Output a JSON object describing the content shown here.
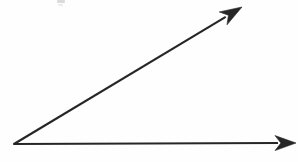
{
  "figure": {
    "background_color": "#fefefe",
    "stroke_color": "#262626",
    "width": 298,
    "height": 162,
    "vertex_label": "",
    "caption": ""
  },
  "chart_data": {
    "type": "diagram",
    "subtitle": "",
    "xlabel": "",
    "ylabel": "",
    "grid": false,
    "legend": "none",
    "axis_ranges": {
      "x": [
        0,
        298
      ],
      "y": [
        0,
        162
      ]
    },
    "coordinate_note": "Pixel coordinates, origin at top-left of the 298x162 image.",
    "vertex": {
      "x": 14,
      "y": 144
    },
    "rays": [
      {
        "name": "horizontal-ray",
        "label": "",
        "from": {
          "x": 14,
          "y": 144
        },
        "to": {
          "x": 296,
          "y": 143
        },
        "length_px": 282,
        "angle_deg": 0,
        "arrowhead": "filled-triangle",
        "arrowhead_length_px": 21,
        "arrowhead_width_px": 15,
        "stroke_width_px": 2.1,
        "color": "#262626"
      },
      {
        "name": "diagonal-ray",
        "label": "",
        "from": {
          "x": 14,
          "y": 144
        },
        "to": {
          "x": 242,
          "y": 7
        },
        "length_px": 266,
        "angle_deg": 31,
        "arrowhead": "filled-triangle",
        "arrowhead_length_px": 22,
        "arrowhead_width_px": 15,
        "stroke_width_px": 2.1,
        "color": "#262626"
      }
    ],
    "angle_between_rays_deg": 31,
    "angle_type": "acute",
    "angle_arc_shown": false,
    "annotations": [
      {
        "name": "scan-artifact",
        "kind": "smudge",
        "x": 57,
        "y": 0,
        "width": 8,
        "height": 5,
        "color": "#8d8d8d",
        "text": ""
      }
    ]
  }
}
